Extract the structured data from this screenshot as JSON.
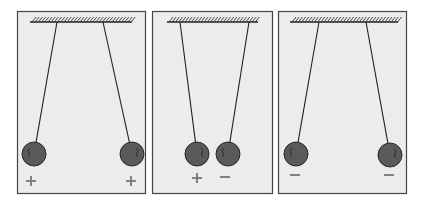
{
  "figure": {
    "colors": {
      "panel_bg": "#ececec",
      "panel_border": "#444444",
      "ball": "#5a5a5a",
      "string": "#222222",
      "sign": "#777777"
    },
    "panels": [
      {
        "id": "panel-like-positive",
        "rect": [
          17,
          11,
          128,
          182
        ],
        "ceiling": [
          30,
          132,
          22
        ],
        "balls": [
          {
            "anchor": [
              57,
              22
            ],
            "center": [
              34,
              154
            ],
            "r": 12,
            "charge": "+",
            "label_pos": [
              31,
              181
            ]
          },
          {
            "anchor": [
              103,
              22
            ],
            "center": [
              132,
              154
            ],
            "r": 12,
            "charge": "+",
            "label_pos": [
              131,
              181
            ]
          }
        ]
      },
      {
        "id": "panel-opposite",
        "rect": [
          152,
          11,
          120,
          182
        ],
        "ceiling": [
          167,
          258,
          22
        ],
        "balls": [
          {
            "anchor": [
              180,
              22
            ],
            "center": [
              197,
              154
            ],
            "r": 12,
            "charge": "+",
            "label_pos": [
              197,
              178
            ]
          },
          {
            "anchor": [
              249,
              22
            ],
            "center": [
              228,
              154
            ],
            "r": 12,
            "charge": "−",
            "label_pos": [
              225,
              177
            ]
          }
        ]
      },
      {
        "id": "panel-like-negative",
        "rect": [
          278,
          11,
          128,
          182
        ],
        "ceiling": [
          290,
          398,
          22
        ],
        "balls": [
          {
            "anchor": [
              319,
              22
            ],
            "center": [
              296,
              154
            ],
            "r": 12,
            "charge": "−",
            "label_pos": [
              295,
              175
            ]
          },
          {
            "anchor": [
              366,
              22
            ],
            "center": [
              390,
              155
            ],
            "r": 12,
            "charge": "−",
            "label_pos": [
              389,
              175
            ]
          }
        ]
      }
    ]
  }
}
